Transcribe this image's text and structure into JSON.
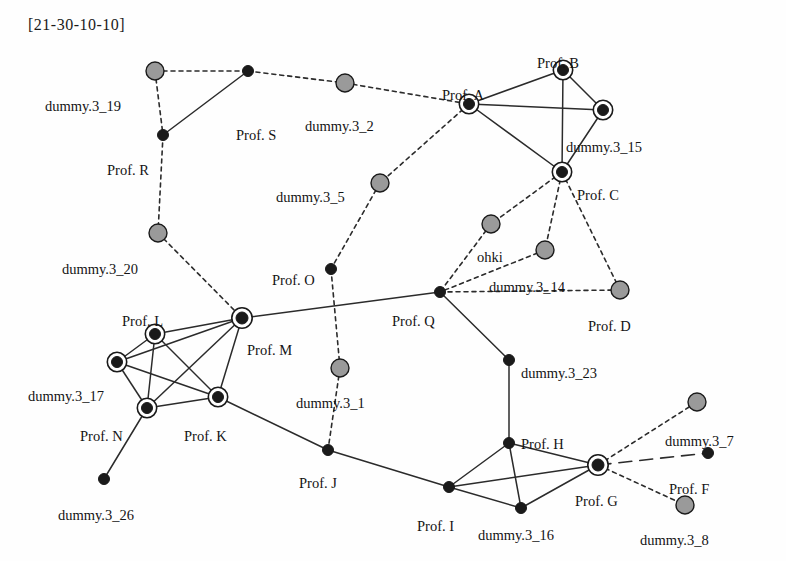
{
  "title": "[21-30-10-10]",
  "figure": {
    "kind": "node-link-network-diagram",
    "width": 786,
    "height": 561,
    "background": "#fefefe",
    "styles": {
      "dark_node_fill": "#1a1a1a",
      "gray_node_fill": "#9a9a9a",
      "node_stroke": "#1a1a1a",
      "ring_stroke": "#1a1a1a",
      "solid_edge_color": "#2b2b2b",
      "dashed_edge_color": "#2b2b2b",
      "label_color": "#141414"
    }
  },
  "chart_data": {
    "type": "network",
    "title": "[21-30-10-10]",
    "node_types": {
      "dark": "filled black circle",
      "gray": "filled gray circle",
      "ringed": "filled black circle with surrounding ring"
    },
    "edge_types": {
      "solid": "solid line",
      "dashed": "short dashed line",
      "longdash": "long dashed line"
    },
    "nodes": [
      {
        "id": "d19",
        "label": "dummy.3_19",
        "x": 155,
        "y": 71,
        "shape": "gray",
        "r": 9,
        "lx": 45,
        "ly": 99,
        "anchor": "start"
      },
      {
        "id": "S",
        "label": "Prof. S",
        "x": 248,
        "y": 71,
        "shape": "dark",
        "r": 5.5,
        "lx": 236,
        "ly": 128,
        "anchor": "start"
      },
      {
        "id": "d2",
        "label": "dummy.3_2",
        "x": 345,
        "y": 83,
        "shape": "gray",
        "r": 9,
        "lx": 305,
        "ly": 119,
        "anchor": "start"
      },
      {
        "id": "R",
        "label": "Prof. R",
        "x": 163,
        "y": 135,
        "shape": "dark",
        "r": 5.5,
        "lx": 107,
        "ly": 163,
        "anchor": "start"
      },
      {
        "id": "A",
        "label": "Prof. A",
        "x": 469,
        "y": 104,
        "shape": "ringed",
        "r": 5.5,
        "lx": 442,
        "ly": 88,
        "anchor": "start"
      },
      {
        "id": "B",
        "label": "Prof. B",
        "x": 563,
        "y": 70,
        "shape": "ringed",
        "r": 5.5,
        "lx": 537,
        "ly": 56,
        "anchor": "start"
      },
      {
        "id": "d15",
        "label": "dummy.3_15",
        "x": 603,
        "y": 110,
        "shape": "ringed",
        "r": 5.5,
        "lx": 566,
        "ly": 140,
        "anchor": "start"
      },
      {
        "id": "C",
        "label": "Prof. C",
        "x": 562,
        "y": 172,
        "shape": "ringed",
        "r": 5.5,
        "lx": 577,
        "ly": 188,
        "anchor": "start"
      },
      {
        "id": "d5",
        "label": "dummy.3_5",
        "x": 380,
        "y": 183,
        "shape": "gray",
        "r": 9,
        "lx": 276,
        "ly": 190,
        "anchor": "start"
      },
      {
        "id": "d20",
        "label": "dummy.3_20",
        "x": 158,
        "y": 233,
        "shape": "gray",
        "r": 9,
        "lx": 62,
        "ly": 262,
        "anchor": "start"
      },
      {
        "id": "ohki",
        "label": "ohki",
        "x": 491,
        "y": 224,
        "shape": "gray",
        "r": 9,
        "lx": 477,
        "ly": 250,
        "anchor": "start"
      },
      {
        "id": "d14",
        "label": "dummy.3_14",
        "x": 545,
        "y": 250,
        "shape": "gray",
        "r": 9,
        "lx": 489,
        "ly": 280,
        "anchor": "start"
      },
      {
        "id": "D",
        "label": "Prof. D",
        "x": 620,
        "y": 290,
        "shape": "gray",
        "r": 9,
        "lx": 588,
        "ly": 319,
        "anchor": "start"
      },
      {
        "id": "O",
        "label": "Prof. O",
        "x": 331,
        "y": 269,
        "shape": "dark",
        "r": 5.5,
        "lx": 272,
        "ly": 273,
        "anchor": "start"
      },
      {
        "id": "Q",
        "label": "Prof. Q",
        "x": 440,
        "y": 292,
        "shape": "dark",
        "r": 5.5,
        "lx": 392,
        "ly": 314,
        "anchor": "start"
      },
      {
        "id": "L",
        "label": "Prof. L",
        "x": 155,
        "y": 334,
        "shape": "ringed",
        "r": 5.5,
        "lx": 122,
        "ly": 314,
        "anchor": "start"
      },
      {
        "id": "M",
        "label": "Prof. M",
        "x": 242,
        "y": 318,
        "shape": "ringed",
        "r": 6,
        "lx": 247,
        "ly": 343,
        "anchor": "start"
      },
      {
        "id": "d17",
        "label": "dummy.3_17",
        "x": 117,
        "y": 362,
        "shape": "ringed",
        "r": 5.5,
        "lx": 28,
        "ly": 389,
        "anchor": "start"
      },
      {
        "id": "d1",
        "label": "dummy.3_1",
        "x": 340,
        "y": 368,
        "shape": "gray",
        "r": 9,
        "lx": 296,
        "ly": 396,
        "anchor": "start"
      },
      {
        "id": "d23",
        "label": "dummy.3_23",
        "x": 509,
        "y": 360,
        "shape": "dark",
        "r": 5.5,
        "lx": 521,
        "ly": 366,
        "anchor": "start"
      },
      {
        "id": "N",
        "label": "Prof. N",
        "x": 147,
        "y": 408,
        "shape": "ringed",
        "r": 5.5,
        "lx": 80,
        "ly": 429,
        "anchor": "start"
      },
      {
        "id": "K",
        "label": "Prof. K",
        "x": 218,
        "y": 397,
        "shape": "ringed",
        "r": 5.5,
        "lx": 184,
        "ly": 429,
        "anchor": "start"
      },
      {
        "id": "d7",
        "label": "dummy.3_7",
        "x": 697,
        "y": 402,
        "shape": "gray",
        "r": 9,
        "lx": 665,
        "ly": 434,
        "anchor": "start"
      },
      {
        "id": "H",
        "label": "Prof. H",
        "x": 509,
        "y": 443,
        "shape": "dark",
        "r": 5.5,
        "lx": 521,
        "ly": 437,
        "anchor": "start"
      },
      {
        "id": "J",
        "label": "Prof. J",
        "x": 328,
        "y": 450,
        "shape": "dark",
        "r": 5.5,
        "lx": 299,
        "ly": 476,
        "anchor": "start"
      },
      {
        "id": "F",
        "label": "Prof. F",
        "x": 708,
        "y": 453,
        "shape": "dark",
        "r": 5.5,
        "lx": 669,
        "ly": 482,
        "anchor": "start"
      },
      {
        "id": "G",
        "label": "Prof. G",
        "x": 598,
        "y": 465,
        "shape": "ringed",
        "r": 6,
        "lx": 575,
        "ly": 494,
        "anchor": "start"
      },
      {
        "id": "d26",
        "label": "dummy.3_26",
        "x": 104,
        "y": 479,
        "shape": "dark",
        "r": 5.5,
        "lx": 58,
        "ly": 508,
        "anchor": "start"
      },
      {
        "id": "I",
        "label": "Prof. I",
        "x": 449,
        "y": 487,
        "shape": "dark",
        "r": 5.5,
        "lx": 417,
        "ly": 519,
        "anchor": "start"
      },
      {
        "id": "d16",
        "label": "dummy.3_16",
        "x": 521,
        "y": 508,
        "shape": "dark",
        "r": 5.5,
        "lx": 478,
        "ly": 528,
        "anchor": "start"
      },
      {
        "id": "d8",
        "label": "dummy.3_8",
        "x": 685,
        "y": 505,
        "shape": "gray",
        "r": 9,
        "lx": 640,
        "ly": 533,
        "anchor": "start"
      }
    ],
    "edges": [
      {
        "from": "d19",
        "to": "S",
        "style": "dashed"
      },
      {
        "from": "S",
        "to": "d2",
        "style": "dashed"
      },
      {
        "from": "d2",
        "to": "A",
        "style": "dashed"
      },
      {
        "from": "d19",
        "to": "R",
        "style": "dashed"
      },
      {
        "from": "S",
        "to": "R",
        "style": "solid"
      },
      {
        "from": "R",
        "to": "d20",
        "style": "dashed"
      },
      {
        "from": "d20",
        "to": "M",
        "style": "dashed"
      },
      {
        "from": "A",
        "to": "B",
        "style": "solid"
      },
      {
        "from": "A",
        "to": "d15",
        "style": "solid"
      },
      {
        "from": "A",
        "to": "C",
        "style": "solid"
      },
      {
        "from": "B",
        "to": "d15",
        "style": "solid"
      },
      {
        "from": "B",
        "to": "C",
        "style": "solid"
      },
      {
        "from": "d15",
        "to": "C",
        "style": "solid"
      },
      {
        "from": "A",
        "to": "d5",
        "style": "dashed"
      },
      {
        "from": "d5",
        "to": "O",
        "style": "dashed"
      },
      {
        "from": "O",
        "to": "d1",
        "style": "dashed"
      },
      {
        "from": "d1",
        "to": "J",
        "style": "dashed"
      },
      {
        "from": "C",
        "to": "ohki",
        "style": "dashed"
      },
      {
        "from": "C",
        "to": "d14",
        "style": "dashed"
      },
      {
        "from": "C",
        "to": "D",
        "style": "dashed"
      },
      {
        "from": "ohki",
        "to": "Q",
        "style": "dashed"
      },
      {
        "from": "d14",
        "to": "Q",
        "style": "dashed"
      },
      {
        "from": "D",
        "to": "Q",
        "style": "dashed"
      },
      {
        "from": "Q",
        "to": "M",
        "style": "solid"
      },
      {
        "from": "Q",
        "to": "d23",
        "style": "solid"
      },
      {
        "from": "d23",
        "to": "H",
        "style": "solid"
      },
      {
        "from": "M",
        "to": "L",
        "style": "solid"
      },
      {
        "from": "M",
        "to": "d17",
        "style": "solid"
      },
      {
        "from": "M",
        "to": "N",
        "style": "solid"
      },
      {
        "from": "M",
        "to": "K",
        "style": "solid"
      },
      {
        "from": "L",
        "to": "d17",
        "style": "solid"
      },
      {
        "from": "L",
        "to": "N",
        "style": "solid"
      },
      {
        "from": "L",
        "to": "K",
        "style": "solid"
      },
      {
        "from": "d17",
        "to": "N",
        "style": "solid"
      },
      {
        "from": "d17",
        "to": "K",
        "style": "solid"
      },
      {
        "from": "N",
        "to": "K",
        "style": "solid"
      },
      {
        "from": "N",
        "to": "d26",
        "style": "solid"
      },
      {
        "from": "K",
        "to": "J",
        "style": "solid"
      },
      {
        "from": "J",
        "to": "I",
        "style": "solid"
      },
      {
        "from": "I",
        "to": "H",
        "style": "solid"
      },
      {
        "from": "I",
        "to": "d16",
        "style": "solid"
      },
      {
        "from": "I",
        "to": "G",
        "style": "solid"
      },
      {
        "from": "H",
        "to": "d16",
        "style": "solid"
      },
      {
        "from": "H",
        "to": "G",
        "style": "solid"
      },
      {
        "from": "d16",
        "to": "G",
        "style": "solid"
      },
      {
        "from": "G",
        "to": "d7",
        "style": "dashed"
      },
      {
        "from": "G",
        "to": "d8",
        "style": "dashed"
      },
      {
        "from": "G",
        "to": "F",
        "style": "longdash"
      }
    ]
  }
}
